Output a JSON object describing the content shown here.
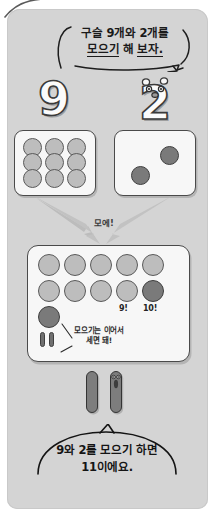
{
  "page": {
    "background_color": "#d4d4d4",
    "corner_mark": "page-curl-stroke"
  },
  "top_bubble": {
    "line1": "구슬 9개와 2개를",
    "line2_underlined_a": "모으기",
    "line2_mid": " 해 ",
    "line2_underlined_b": "보자.",
    "full_text": "구슬 9개와 2개를 모으기 해 보자."
  },
  "numerals": {
    "left": "9",
    "right": "2",
    "right_has_face": true
  },
  "left_box": {
    "label": "marble-box-nine",
    "count": 9,
    "marble_color": "#bdbdbd",
    "layout": "3x3"
  },
  "right_box": {
    "label": "marble-box-two",
    "count": 2,
    "marble_color": "#7a7a7a",
    "layout": "scattered"
  },
  "arrow": {
    "label": "모에!",
    "direction": "converging-down"
  },
  "result_box": {
    "total": 11,
    "rows": [
      {
        "marbles": [
          "light",
          "light",
          "light",
          "light",
          "light"
        ]
      },
      {
        "marbles": [
          "light",
          "light",
          "light",
          "light",
          "dark"
        ]
      },
      {
        "marbles": [
          "dark"
        ]
      }
    ],
    "count_labels": [
      "9!",
      "10!"
    ],
    "note_line1": "모으기는 이어서",
    "note_line2": "세면 돼!",
    "note_full": "모으기는 이어서 세면 돼!"
  },
  "sticks": {
    "count": 2,
    "second_has_face": true,
    "color": "#7d7d7d"
  },
  "bottom_bubble": {
    "line1": "9와 2를 모으기 하면",
    "line2": "11이에요.",
    "full_text": "9와 2를 모으기 하면 11이에요."
  }
}
